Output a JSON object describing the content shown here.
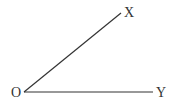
{
  "diagram": {
    "type": "angle",
    "vertex": {
      "label": "O",
      "x": 24,
      "y": 92
    },
    "rays": [
      {
        "label": "X",
        "end_x": 121,
        "end_y": 13
      },
      {
        "label": "Y",
        "end_x": 153,
        "end_y": 92
      }
    ],
    "colors": {
      "line": "#333333",
      "background": "#ffffff"
    }
  }
}
